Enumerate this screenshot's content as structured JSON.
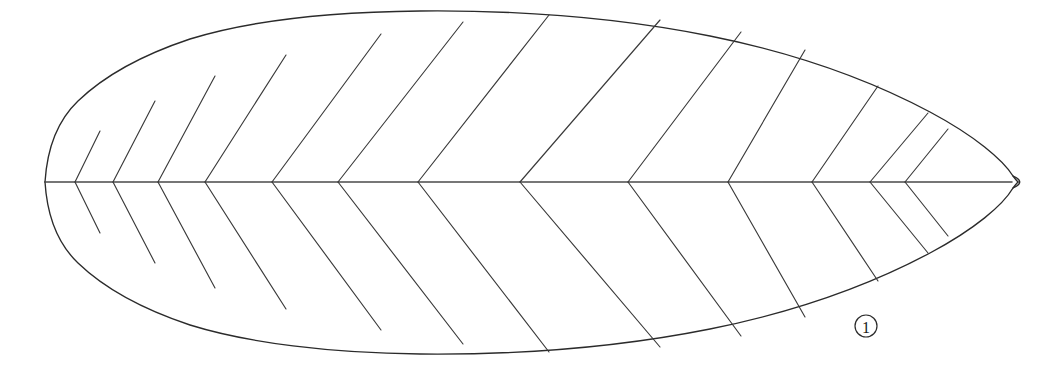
{
  "figure": {
    "kind": "line-drawing",
    "background_color": "#ffffff",
    "line_color": "#2b2b2b",
    "canvas": {
      "width": 1039,
      "height": 384
    }
  },
  "leaf": {
    "shape_name": "elliptic-lanceolate-leaf-outline",
    "apex_label": "right-apex",
    "base_label": "left-base",
    "outline": {
      "left_tip_x": 45,
      "right_tip_x": 1018,
      "top_extreme_y": 14,
      "bottom_extreme_y": 357,
      "axis_y": 182,
      "top_curve": "M 45,182 C 47,150 56,122 78,101 C 104,76 142,55 190,39 C 248,21 330,12 420,11 C 520,10 620,18 710,36 C 790,52 866,78 930,112 C 975,136 1003,160 1013,176 C 1016,180 1017,181 1018,182",
      "bottom_curve": "M 45,182 C 47,214 56,242 78,263 C 104,288 142,309 190,325 C 248,343 330,353 420,354 C 520,355 620,347 710,329 C 790,313 866,287 930,253 C 975,229 1003,205 1013,188 C 1016,184 1017,183 1018,182",
      "right_tip_curve": "M 1013,176 C 1022,180 1022,184 1013,188"
    },
    "midrib": {
      "name": "midrib",
      "from_x": 45,
      "to_x": 1012,
      "y": 182
    }
  },
  "veins": {
    "count_pairs": 13,
    "description": "paired lateral veins forming chevrons that meet the midrib and run up-and-right to the margin",
    "pairs": [
      {
        "index": 1,
        "junction_x": 75,
        "top_end_x": 100,
        "top_end_y": 131,
        "bottom_end_x": 100,
        "bottom_end_y": 233
      },
      {
        "index": 2,
        "junction_x": 113,
        "top_end_x": 155,
        "top_end_y": 101,
        "bottom_end_x": 155,
        "bottom_end_y": 263
      },
      {
        "index": 3,
        "junction_x": 158,
        "top_end_x": 215,
        "top_end_y": 76,
        "bottom_end_x": 215,
        "bottom_end_y": 288
      },
      {
        "index": 4,
        "junction_x": 205,
        "top_end_x": 286,
        "top_end_y": 55,
        "bottom_end_x": 286,
        "bottom_end_y": 309
      },
      {
        "index": 5,
        "junction_x": 272,
        "top_end_x": 381,
        "top_end_y": 34,
        "bottom_end_x": 381,
        "bottom_end_y": 330
      },
      {
        "index": 6,
        "junction_x": 338,
        "top_end_x": 463,
        "top_end_y": 22,
        "bottom_end_x": 463,
        "bottom_end_y": 344
      },
      {
        "index": 7,
        "junction_x": 418,
        "top_end_x": 549,
        "top_end_y": 15,
        "bottom_end_x": 549,
        "bottom_end_y": 352
      },
      {
        "index": 8,
        "junction_x": 520,
        "top_end_x": 660,
        "top_end_y": 20,
        "bottom_end_x": 660,
        "bottom_end_y": 347
      },
      {
        "index": 9,
        "junction_x": 628,
        "top_end_x": 741,
        "top_end_y": 32,
        "bottom_end_x": 741,
        "bottom_end_y": 336
      },
      {
        "index": 10,
        "junction_x": 728,
        "top_end_x": 805,
        "top_end_y": 50,
        "bottom_end_x": 805,
        "bottom_end_y": 317
      },
      {
        "index": 11,
        "junction_x": 812,
        "top_end_x": 878,
        "top_end_y": 86,
        "bottom_end_x": 878,
        "bottom_end_y": 281
      },
      {
        "index": 12,
        "junction_x": 870,
        "top_end_x": 928,
        "top_end_y": 113,
        "bottom_end_x": 928,
        "bottom_end_y": 253
      },
      {
        "index": 13,
        "junction_x": 905,
        "top_end_x": 948,
        "top_end_y": 129,
        "bottom_end_x": 948,
        "bottom_end_y": 236
      }
    ]
  },
  "annotations": {
    "callouts": [
      {
        "name": "callout-1",
        "label": "1",
        "center_x": 866,
        "center_y": 326,
        "radius": 11
      }
    ]
  }
}
